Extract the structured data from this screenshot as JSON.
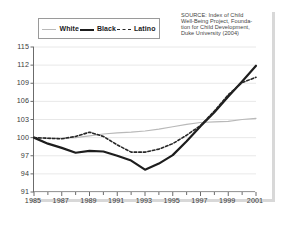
{
  "legend": {
    "position": "top-left",
    "items": [
      {
        "label": "White",
        "key": "white",
        "style": "thin-solid-grey",
        "color": "#b9b9b9"
      },
      {
        "label": "Black",
        "key": "black",
        "style": "thick-solid-black",
        "color": "#1d1d1d"
      },
      {
        "label": "Latino",
        "key": "latino",
        "style": "dashed-black",
        "color": "#262626"
      }
    ]
  },
  "source_note": {
    "lines": [
      "SOURCE: Index of Child",
      "Well-Being Project, Founda-",
      "tion for Child Development,",
      "Duke University (2004)"
    ]
  },
  "chart_data": {
    "type": "line",
    "title": "",
    "subtitle": "",
    "xlabel": "",
    "ylabel": "",
    "xlim": [
      1985,
      2001
    ],
    "ylim": [
      91,
      115
    ],
    "ytick_step": 3,
    "grid": "horizontal",
    "legend_position": "top-left",
    "x": [
      1985,
      1986,
      1987,
      1988,
      1989,
      1990,
      1991,
      1992,
      1993,
      1994,
      1995,
      1996,
      1997,
      1998,
      1999,
      2000,
      2001
    ],
    "xtick_labels": [
      "1985",
      "1987",
      "1989",
      "1991",
      "1993",
      "1995",
      "1997",
      "1999",
      "2001"
    ],
    "xtick_values": [
      1985,
      1987,
      1989,
      1991,
      1993,
      1995,
      1997,
      1999,
      2001
    ],
    "ytick_labels": [
      "91",
      "94",
      "97",
      "100",
      "103",
      "106",
      "109",
      "112",
      "115"
    ],
    "ytick_values": [
      91,
      94,
      97,
      100,
      103,
      106,
      109,
      112,
      115
    ],
    "series": [
      {
        "name": "White",
        "color": "#b9b9b9",
        "style": "solid",
        "width": 1.2,
        "values": [
          100.0,
          99.9,
          99.9,
          100.0,
          100.3,
          100.6,
          100.8,
          100.9,
          101.1,
          101.4,
          101.8,
          102.2,
          102.5,
          102.6,
          102.7,
          103.0,
          103.2
        ]
      },
      {
        "name": "Black",
        "color": "#1d1d1d",
        "style": "solid",
        "width": 2.2,
        "values": [
          100.0,
          99.0,
          98.3,
          97.5,
          97.8,
          97.7,
          97.0,
          96.2,
          94.7,
          95.7,
          97.1,
          99.4,
          101.9,
          104.2,
          106.8,
          109.3,
          111.9
        ]
      },
      {
        "name": "Latino",
        "color": "#262626",
        "style": "dashed",
        "width": 1.6,
        "values": [
          100.0,
          99.9,
          99.8,
          100.2,
          100.9,
          100.2,
          98.8,
          97.6,
          97.6,
          98.1,
          99.0,
          100.4,
          102.0,
          104.4,
          107.1,
          109.1,
          110.0
        ]
      }
    ]
  }
}
